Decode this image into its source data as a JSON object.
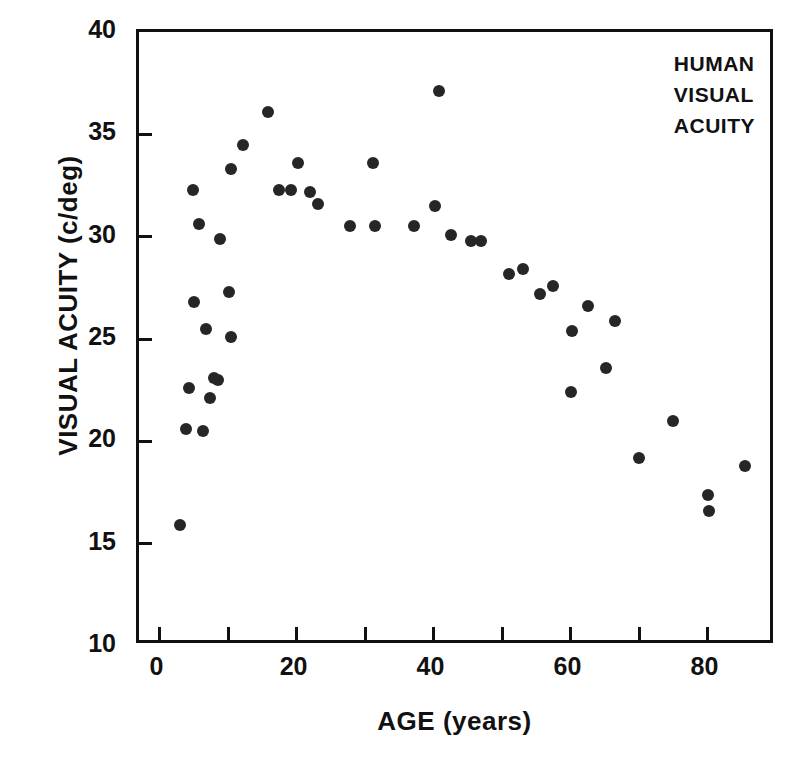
{
  "chart_data": {
    "type": "scatter",
    "title": "",
    "annotation_lines": [
      "HUMAN",
      "VISUAL",
      "ACUITY"
    ],
    "xlabel": "AGE (years)",
    "ylabel": "VISUAL ACUITY (c/deg)",
    "xlim": [
      -3,
      90
    ],
    "ylim": [
      10,
      40
    ],
    "xticks_major": [
      0,
      20,
      40,
      60,
      80
    ],
    "xticks_all": [
      0,
      10,
      20,
      30,
      40,
      50,
      60,
      70,
      80
    ],
    "xtick_labels": [
      "0",
      "20",
      "40",
      "60",
      "80"
    ],
    "yticks": [
      10,
      15,
      20,
      25,
      30,
      35,
      40
    ],
    "ytick_labels": [
      "10",
      "15",
      "20",
      "25",
      "30",
      "35",
      "40"
    ],
    "grid": false,
    "legend": "none",
    "marker": "filled-circle",
    "marker_color": "#262626",
    "points": [
      {
        "x": 3.0,
        "y": 15.9
      },
      {
        "x": 3.9,
        "y": 20.6
      },
      {
        "x": 6.4,
        "y": 20.5
      },
      {
        "x": 4.3,
        "y": 22.6
      },
      {
        "x": 7.3,
        "y": 22.1
      },
      {
        "x": 8.0,
        "y": 23.1
      },
      {
        "x": 8.5,
        "y": 23.0
      },
      {
        "x": 6.8,
        "y": 25.5
      },
      {
        "x": 10.5,
        "y": 25.1
      },
      {
        "x": 5.0,
        "y": 26.8
      },
      {
        "x": 10.2,
        "y": 27.3
      },
      {
        "x": 8.8,
        "y": 29.9
      },
      {
        "x": 5.8,
        "y": 30.6
      },
      {
        "x": 4.9,
        "y": 32.3
      },
      {
        "x": 10.5,
        "y": 33.3
      },
      {
        "x": 12.2,
        "y": 34.5
      },
      {
        "x": 15.8,
        "y": 36.1
      },
      {
        "x": 17.5,
        "y": 32.3
      },
      {
        "x": 19.2,
        "y": 32.3
      },
      {
        "x": 20.2,
        "y": 33.6
      },
      {
        "x": 22.0,
        "y": 32.2
      },
      {
        "x": 23.2,
        "y": 31.6
      },
      {
        "x": 27.8,
        "y": 30.5
      },
      {
        "x": 31.2,
        "y": 33.6
      },
      {
        "x": 31.5,
        "y": 30.5
      },
      {
        "x": 37.2,
        "y": 30.5
      },
      {
        "x": 40.8,
        "y": 37.1
      },
      {
        "x": 40.2,
        "y": 31.5
      },
      {
        "x": 42.5,
        "y": 30.1
      },
      {
        "x": 45.5,
        "y": 29.8
      },
      {
        "x": 47.0,
        "y": 29.8
      },
      {
        "x": 51.0,
        "y": 28.2
      },
      {
        "x": 53.0,
        "y": 28.4
      },
      {
        "x": 55.5,
        "y": 27.2
      },
      {
        "x": 57.5,
        "y": 27.6
      },
      {
        "x": 60.2,
        "y": 25.4
      },
      {
        "x": 60.0,
        "y": 22.4
      },
      {
        "x": 62.5,
        "y": 26.6
      },
      {
        "x": 65.2,
        "y": 23.6
      },
      {
        "x": 66.5,
        "y": 25.9
      },
      {
        "x": 70.0,
        "y": 19.2
      },
      {
        "x": 75.0,
        "y": 21.0
      },
      {
        "x": 80.0,
        "y": 17.4
      },
      {
        "x": 80.2,
        "y": 16.6
      },
      {
        "x": 85.5,
        "y": 18.8
      }
    ]
  }
}
